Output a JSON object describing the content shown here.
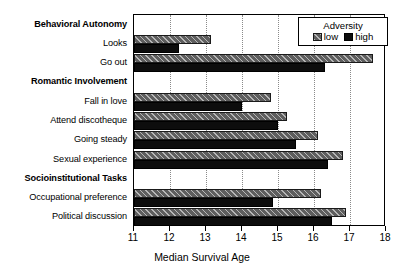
{
  "chart_data": {
    "type": "bar",
    "orientation": "horizontal",
    "title": "",
    "xlabel": "Median Survival Age",
    "ylabel": "",
    "xlim": [
      11,
      18
    ],
    "xticks": [
      11,
      12,
      13,
      14,
      15,
      16,
      17,
      18
    ],
    "grid": "vertical-dotted",
    "legend": {
      "title": "Adversity",
      "position": "top-right",
      "entries": [
        {
          "name": "low",
          "color": "#5e5e5e",
          "pattern": "hatched"
        },
        {
          "name": "high",
          "color": "#0d0d0d",
          "pattern": "solid"
        }
      ]
    },
    "categories": [
      "Behavioral Autonomy",
      "Looks",
      "Go out",
      "Romantic Involvement",
      "Fall in love",
      "Attend discotheque",
      "Going steady",
      "Sexual experience",
      "Socioinstitutional Tasks",
      "Occupational preference",
      "Political discussion"
    ],
    "category_is_header": [
      true,
      false,
      false,
      true,
      false,
      false,
      false,
      false,
      true,
      false,
      false
    ],
    "series": [
      {
        "name": "low",
        "values": [
          null,
          13.15,
          17.65,
          null,
          14.8,
          15.25,
          16.1,
          16.8,
          null,
          16.2,
          16.9
        ]
      },
      {
        "name": "high",
        "values": [
          null,
          12.25,
          16.3,
          null,
          14.0,
          15.0,
          15.5,
          16.4,
          null,
          14.85,
          16.5
        ]
      }
    ]
  },
  "axis": {
    "x_tick_labels": [
      "11",
      "12",
      "13",
      "14",
      "15",
      "16",
      "17",
      "18"
    ],
    "x_axis_title": "Median Survival Age"
  },
  "legend": {
    "title": "Adversity",
    "low_label": "low",
    "high_label": "high"
  },
  "colors": {
    "low_bar": "#5e5e5e",
    "high_bar": "#0d0d0d",
    "frame": "#000000",
    "gridline": "#8a8a8a",
    "background": "#ffffff"
  }
}
